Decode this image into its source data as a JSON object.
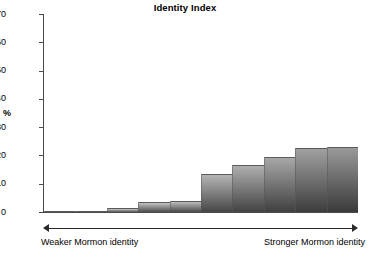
{
  "chart_data": {
    "type": "bar",
    "title": "Identity Index",
    "xlabel": "",
    "ylabel": "%",
    "ylim": [
      0,
      70
    ],
    "ytickstep": 10,
    "yticks": [
      70,
      60,
      50,
      40,
      30,
      20,
      10,
      0
    ],
    "grid": false,
    "legend": null,
    "categories": [
      "1",
      "2",
      "3",
      "4",
      "5",
      "6",
      "7",
      "8",
      "9",
      "10"
    ],
    "values": [
      0.2,
      0.2,
      1.5,
      3.5,
      4,
      13.3,
      16.6,
      19.4,
      22.5,
      23
    ],
    "annotations": {
      "left_axis_note": "Weaker Mormon identity",
      "right_axis_note": "Stronger Mormon identity",
      "axis_arrow": "double-headed-arrow"
    },
    "bar_style": {
      "fill": "vertical-gradient-light-top-dark-bottom",
      "gradient_top": "#d8d8d8",
      "gradient_bottom": "#4a4a4a",
      "edge": "#5a5a5a"
    }
  },
  "axis": {
    "y_title": "%",
    "tick_labels": [
      "70",
      "60",
      "50",
      "40",
      "30",
      "20",
      "10",
      "0"
    ]
  },
  "colors": {
    "axis": "#4a4a4a",
    "text": "#000000",
    "arrow": "#2b2b2b",
    "background": "#ffffff"
  }
}
